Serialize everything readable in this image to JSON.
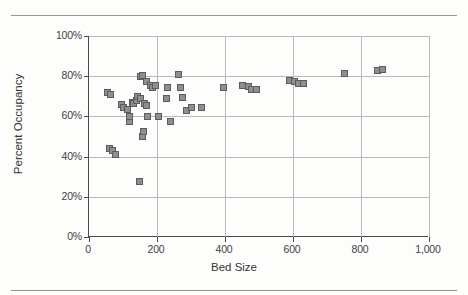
{
  "chart_data": {
    "type": "scatter",
    "title": "",
    "xlabel": "Bed Size",
    "ylabel": "Percent Occupancy",
    "xlim": [
      0,
      1000
    ],
    "ylim": [
      0,
      1.0
    ],
    "grid": true,
    "legend": null,
    "xticks": [
      "0",
      "200",
      "400",
      "600",
      "800",
      "1,000"
    ],
    "xtick_values": [
      0,
      200,
      400,
      600,
      800,
      1000
    ],
    "yticks": [
      "0%",
      "20%",
      "40%",
      "60%",
      "80%",
      "100%"
    ],
    "ytick_values": [
      0,
      0.2,
      0.4,
      0.6,
      0.8,
      1.0
    ],
    "marker": "square",
    "marker_color": "#8e8e8e",
    "marker_edge_color": "#5c5c5c",
    "points": [
      {
        "x": 55,
        "y": 0.72
      },
      {
        "x": 62,
        "y": 0.71
      },
      {
        "x": 60,
        "y": 0.44
      },
      {
        "x": 68,
        "y": 0.43
      },
      {
        "x": 78,
        "y": 0.41
      },
      {
        "x": 95,
        "y": 0.66
      },
      {
        "x": 100,
        "y": 0.645
      },
      {
        "x": 112,
        "y": 0.635
      },
      {
        "x": 118,
        "y": 0.575
      },
      {
        "x": 120,
        "y": 0.6
      },
      {
        "x": 128,
        "y": 0.67
      },
      {
        "x": 132,
        "y": 0.665
      },
      {
        "x": 140,
        "y": 0.68
      },
      {
        "x": 142,
        "y": 0.7
      },
      {
        "x": 148,
        "y": 0.275
      },
      {
        "x": 150,
        "y": 0.69
      },
      {
        "x": 152,
        "y": 0.8
      },
      {
        "x": 156,
        "y": 0.805
      },
      {
        "x": 158,
        "y": 0.5
      },
      {
        "x": 160,
        "y": 0.525
      },
      {
        "x": 162,
        "y": 0.665
      },
      {
        "x": 168,
        "y": 0.655
      },
      {
        "x": 170,
        "y": 0.775
      },
      {
        "x": 172,
        "y": 0.6
      },
      {
        "x": 180,
        "y": 0.755
      },
      {
        "x": 188,
        "y": 0.745
      },
      {
        "x": 196,
        "y": 0.755
      },
      {
        "x": 205,
        "y": 0.6
      },
      {
        "x": 228,
        "y": 0.69
      },
      {
        "x": 232,
        "y": 0.745
      },
      {
        "x": 240,
        "y": 0.575
      },
      {
        "x": 262,
        "y": 0.81
      },
      {
        "x": 268,
        "y": 0.745
      },
      {
        "x": 276,
        "y": 0.695
      },
      {
        "x": 288,
        "y": 0.63
      },
      {
        "x": 300,
        "y": 0.645
      },
      {
        "x": 330,
        "y": 0.645
      },
      {
        "x": 395,
        "y": 0.745
      },
      {
        "x": 452,
        "y": 0.755
      },
      {
        "x": 470,
        "y": 0.75
      },
      {
        "x": 478,
        "y": 0.735
      },
      {
        "x": 492,
        "y": 0.735
      },
      {
        "x": 590,
        "y": 0.78
      },
      {
        "x": 605,
        "y": 0.775
      },
      {
        "x": 615,
        "y": 0.765
      },
      {
        "x": 632,
        "y": 0.765
      },
      {
        "x": 752,
        "y": 0.815
      },
      {
        "x": 848,
        "y": 0.83
      },
      {
        "x": 862,
        "y": 0.835
      }
    ]
  }
}
